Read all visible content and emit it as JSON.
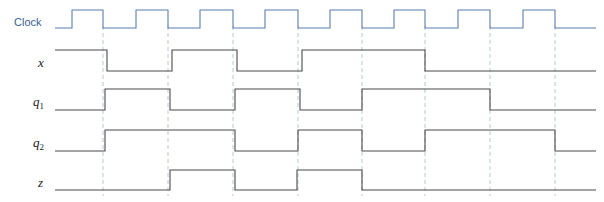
{
  "figure": {
    "type": "timing-diagram",
    "width": 604,
    "height": 202,
    "background": "#ffffff"
  },
  "colors": {
    "clock_label": "#3a5f92",
    "clock_wave": "#5b7fb0",
    "signal_wave": "#4a4a4a",
    "signal_label": "#222222",
    "gridline": "#b9c6d6"
  },
  "labels": {
    "clock": "Clock",
    "x": "x",
    "q1_base": "q",
    "q1_sub": "1",
    "q2_base": "q",
    "q2_sub": "2",
    "z": "z"
  },
  "geometry": {
    "wave_start_x": 55,
    "wave_end_x": 596,
    "clock_first_rise_x": 72,
    "clock_period": 65,
    "clock_high_width": 31,
    "gridlines": [
      103,
      168,
      233,
      298,
      362,
      425,
      490,
      555
    ],
    "rows": [
      {
        "name": "clock",
        "high_y": 10,
        "low_y": 28
      },
      {
        "name": "x",
        "high_y": 50,
        "low_y": 71
      },
      {
        "name": "q1",
        "high_y": 89,
        "low_y": 110
      },
      {
        "name": "q2",
        "high_y": 130,
        "low_y": 151
      },
      {
        "name": "z",
        "high_y": 170,
        "low_y": 190
      }
    ],
    "label_positions": {
      "clock": {
        "x": 14,
        "y": 26
      },
      "x": {
        "x": 38,
        "y": 67
      },
      "q1": {
        "x": 33,
        "y": 106
      },
      "q2": {
        "x": 33,
        "y": 147
      },
      "z": {
        "x": 38,
        "y": 187
      }
    }
  },
  "chart_data": {
    "type": "line",
    "title": "",
    "xlabel": "",
    "ylabel": "",
    "signals": [
      {
        "name": "Clock",
        "label": "Clock",
        "color": "#5b7fb0",
        "initial_level": 0,
        "transitions_x": [
          72,
          103,
          136,
          168,
          200,
          233,
          265,
          298,
          330,
          362,
          394,
          425,
          458,
          490,
          523,
          555
        ],
        "levels": [
          0,
          1,
          0,
          1,
          0,
          1,
          0,
          1,
          0,
          1,
          0,
          1,
          0,
          1,
          0,
          1,
          0
        ]
      },
      {
        "name": "x",
        "label": "x",
        "color": "#4a4a4a",
        "initial_level": 1,
        "transitions_x": [
          107,
          172,
          237,
          302,
          425
        ],
        "levels": [
          1,
          0,
          1,
          0,
          1,
          0
        ]
      },
      {
        "name": "q1",
        "label": "q1",
        "color": "#4a4a4a",
        "initial_level": 0,
        "transitions_x": [
          105,
          170,
          235,
          300,
          362,
          490
        ],
        "levels": [
          0,
          1,
          0,
          1,
          0,
          1,
          0
        ]
      },
      {
        "name": "q2",
        "label": "q2",
        "color": "#4a4a4a",
        "initial_level": 0,
        "transitions_x": [
          105,
          235,
          298,
          362,
          425,
          555
        ],
        "levels": [
          0,
          1,
          0,
          1,
          0,
          1,
          0
        ]
      },
      {
        "name": "z",
        "label": "z",
        "color": "#4a4a4a",
        "initial_level": 0,
        "transitions_x": [
          170,
          235,
          297,
          362
        ],
        "levels": [
          0,
          1,
          0,
          1,
          0
        ]
      }
    ],
    "gridlines_x": [
      103,
      168,
      233,
      298,
      362,
      425,
      490,
      555
    ]
  }
}
